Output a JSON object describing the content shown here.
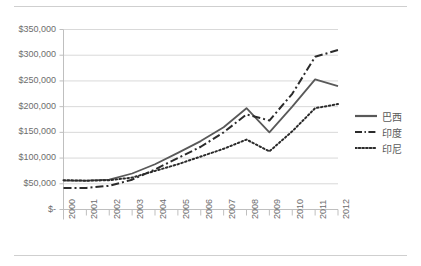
{
  "chart_data": {
    "type": "line",
    "title": "",
    "subtitle": "",
    "xlabel": "",
    "ylabel": "",
    "grid": true,
    "legend_position": "right",
    "categories": [
      "2000",
      "2001",
      "2002",
      "2003",
      "2004",
      "2005",
      "2006",
      "2007",
      "2008",
      "2009",
      "2010",
      "2011",
      "2012"
    ],
    "x": [
      2000,
      2001,
      2002,
      2003,
      2004,
      2005,
      2006,
      2007,
      2008,
      2009,
      2010,
      2011,
      2012
    ],
    "xlim": [
      2000,
      2012
    ],
    "ylim": [
      0,
      350000
    ],
    "ytick_values": [
      0,
      50000,
      100000,
      150000,
      200000,
      250000,
      300000,
      350000
    ],
    "ytick_labels": [
      "$-",
      "$50,000",
      "$100,000",
      "$150,000",
      "$200,000",
      "$250,000",
      "$300,000",
      "$350,000"
    ],
    "series": [
      {
        "name": "巴西",
        "style": "solid",
        "color": "#595959",
        "values": [
          56000,
          56000,
          58000,
          70000,
          88000,
          110000,
          133000,
          160000,
          197000,
          150000,
          200000,
          253000,
          240000
        ]
      },
      {
        "name": "印度",
        "style": "dash-dot",
        "color": "#2b2b2b",
        "values": [
          42000,
          42000,
          46000,
          58000,
          78000,
          100000,
          122000,
          150000,
          185000,
          173000,
          225000,
          297000,
          310000
        ]
      },
      {
        "name": "印尼",
        "style": "dotted",
        "color": "#2b2b2b",
        "values": [
          57000,
          56000,
          57000,
          62000,
          75000,
          88000,
          103000,
          118000,
          136000,
          113000,
          152000,
          197000,
          205000
        ]
      }
    ]
  },
  "legend": {
    "items": [
      {
        "label": "巴西"
      },
      {
        "label": "印度"
      },
      {
        "label": "印尼"
      }
    ]
  }
}
